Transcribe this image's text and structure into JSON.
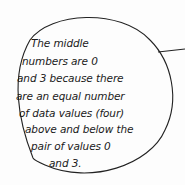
{
  "bubble": {
    "lines": [
      "The middle",
      "numbers are 0",
      "and 3 because there",
      "are an equal number",
      "of data values (four)",
      "above and below the",
      "pair of values 0",
      "and 3."
    ],
    "stroke_color": "#222222",
    "background_color": "#fdfdfd"
  }
}
